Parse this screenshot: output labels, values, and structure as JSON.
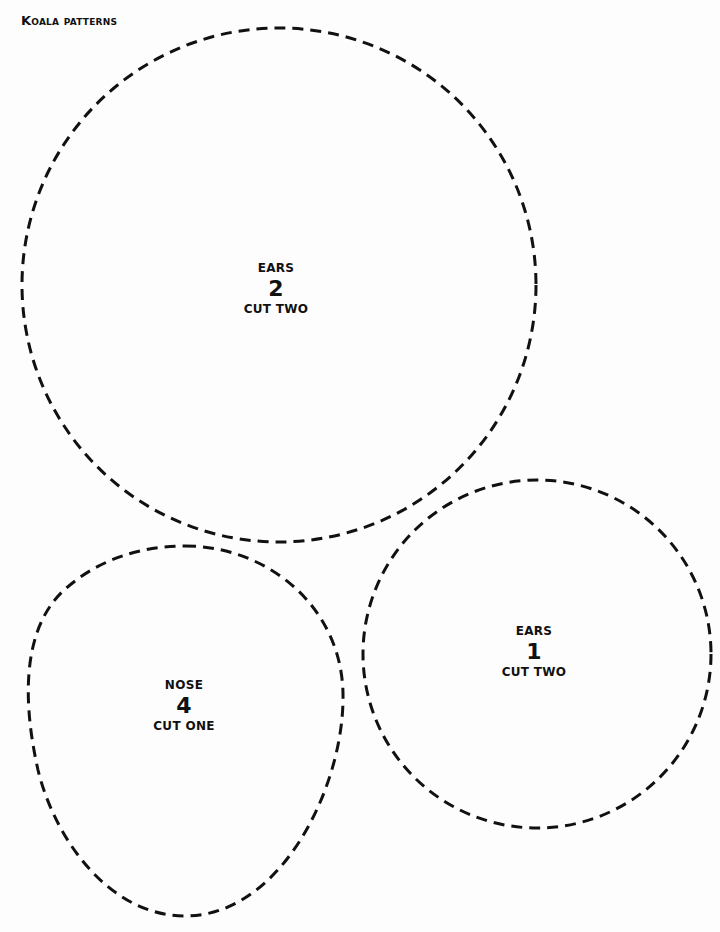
{
  "page": {
    "title": "Koala patterns",
    "background": "#fdfdfd",
    "stroke_color": "#111111"
  },
  "pieces": [
    {
      "id": "ears-large",
      "part": "EARS",
      "number": "2",
      "instruction": "CUT TWO",
      "shape": "circle"
    },
    {
      "id": "ears-small",
      "part": "EARS",
      "number": "1",
      "instruction": "CUT TWO",
      "shape": "circle"
    },
    {
      "id": "nose",
      "part": "NOSE",
      "number": "4",
      "instruction": "CUT ONE",
      "shape": "egg"
    }
  ]
}
